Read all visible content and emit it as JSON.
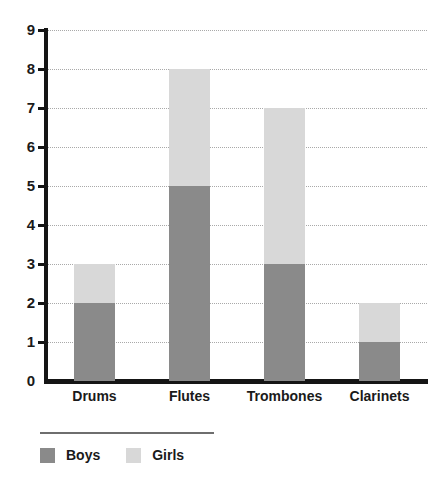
{
  "chart_data": {
    "type": "bar",
    "stacked": true,
    "orientation": "vertical",
    "title": "",
    "subtitle": "",
    "xlabel": "",
    "ylabel": "",
    "categories": [
      "Drums",
      "Flutes",
      "Trombones",
      "Clarinets"
    ],
    "series": [
      {
        "name": "Boys",
        "values": [
          2,
          5,
          3,
          1
        ],
        "color": "#8a8a8a"
      },
      {
        "name": "Girls",
        "values": [
          1,
          3,
          4,
          1
        ],
        "color": "#d8d8d8"
      }
    ],
    "totals": [
      3,
      8,
      7,
      2
    ],
    "ylim": [
      0,
      9
    ],
    "ytick_step": 1,
    "yticks": [
      "0",
      "1",
      "2",
      "3",
      "4",
      "5",
      "6",
      "7",
      "8",
      "9"
    ],
    "grid": true,
    "grid_orientation": "horizontal",
    "grid_style": "dotted",
    "legend_position": "bottom-left",
    "annotations": []
  },
  "axes": {
    "y_tick_labels": [
      "9",
      "8",
      "7",
      "6",
      "5",
      "4",
      "3",
      "2",
      "1",
      "0"
    ],
    "x_tick_labels": [
      "Drums",
      "Flutes",
      "Trombones",
      "Clarinets"
    ]
  },
  "legend": {
    "items": [
      {
        "label": "Boys",
        "color": "#8a8a8a"
      },
      {
        "label": "Girls",
        "color": "#d8d8d8"
      }
    ]
  },
  "colors": {
    "boys": "#8a8a8a",
    "girls": "#d8d8d8",
    "axis": "#151515",
    "grid": "#a9a9a9",
    "text": "#1a1a1a",
    "background": "#ffffff",
    "legend_rule": "#6e6e6e"
  }
}
